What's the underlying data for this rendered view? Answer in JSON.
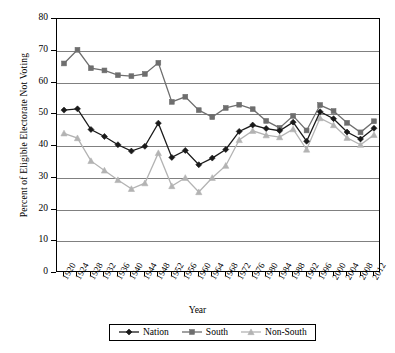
{
  "chart_data": {
    "type": "line",
    "title": "",
    "xlabel": "Year",
    "ylabel": "Percent of Eligible Electorate Not Voting",
    "ylim": [
      0,
      80
    ],
    "ytick_step": 10,
    "grid": true,
    "legend_position": "bottom",
    "categories": [
      1920,
      1924,
      1928,
      1932,
      1936,
      1940,
      1944,
      1948,
      1952,
      1956,
      1960,
      1964,
      1968,
      1972,
      1976,
      1980,
      1984,
      1988,
      1992,
      1996,
      2000,
      2004,
      2008,
      2012
    ],
    "xticklabels": [
      "1920",
      "1924",
      "1928",
      "1932",
      "1936",
      "1940",
      "1944",
      "1948",
      "1952",
      "1956",
      "1960",
      "1964",
      "1968",
      "1972",
      "1976",
      "1980",
      "1984",
      "1988",
      "1992",
      "1996",
      "2000",
      "2004",
      "2008",
      "2012"
    ],
    "yticklabels": [
      "0",
      "10",
      "20",
      "30",
      "40",
      "50",
      "60",
      "70",
      "80"
    ],
    "series": [
      {
        "name": "Nation",
        "color": "#1a1a1a",
        "marker": "diamond",
        "values": [
          51.3,
          51.7,
          45.2,
          43.0,
          40.4,
          38.4,
          39.9,
          47.2,
          36.4,
          38.6,
          34.1,
          36.2,
          38.9,
          44.6,
          46.6,
          45.5,
          44.8,
          47.5,
          41.5,
          50.8,
          48.6,
          44.4,
          42.2,
          45.6
        ]
      },
      {
        "name": "South",
        "color": "#6e6e6e",
        "marker": "square",
        "values": [
          66.0,
          70.3,
          64.5,
          63.8,
          62.3,
          62.0,
          62.7,
          66.2,
          53.9,
          55.5,
          51.3,
          49.1,
          52.0,
          53.0,
          51.6,
          47.9,
          45.7,
          49.5,
          44.9,
          52.9,
          51.0,
          47.3,
          44.3,
          47.8
        ]
      },
      {
        "name": "Non-South",
        "color": "#b3b3b3",
        "marker": "triangle",
        "values": [
          44.0,
          42.5,
          35.3,
          32.3,
          29.3,
          26.5,
          28.3,
          37.8,
          27.4,
          30.0,
          25.5,
          30.0,
          33.8,
          41.9,
          44.8,
          43.4,
          42.8,
          45.3,
          38.9,
          48.8,
          46.6,
          42.6,
          40.4,
          43.5
        ]
      }
    ]
  },
  "legend": {
    "items": [
      {
        "label": "Nation"
      },
      {
        "label": "South"
      },
      {
        "label": "Non-South"
      }
    ]
  }
}
